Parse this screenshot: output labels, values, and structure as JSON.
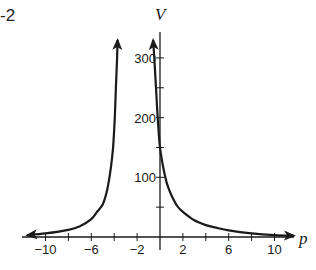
{
  "figure": {
    "partial_label": "-2"
  },
  "chart_data": {
    "type": "line",
    "title": "",
    "xlabel": "p",
    "ylabel": "V",
    "xlim": [
      -11.5,
      11.5
    ],
    "ylim": [
      0,
      320
    ],
    "x_ticks": [
      -10,
      -8,
      -6,
      -4,
      -2,
      2,
      4,
      6,
      8,
      10
    ],
    "x_tick_labels": [
      {
        "value": -10,
        "label": "−10"
      },
      {
        "value": -6,
        "label": "−6"
      },
      {
        "value": -2,
        "label": "−2"
      },
      {
        "value": 2,
        "label": "2"
      },
      {
        "value": 6,
        "label": "6"
      },
      {
        "value": 10,
        "label": "10"
      }
    ],
    "y_ticks": [
      50,
      100,
      150,
      200,
      250,
      300
    ],
    "y_tick_labels": [
      {
        "value": 100,
        "label": "100"
      },
      {
        "value": 200,
        "label": "200"
      },
      {
        "value": 300,
        "label": "300"
      }
    ],
    "grid": false,
    "legend": null,
    "vertical_asymptote_approx": -2,
    "series": [
      {
        "name": "left branch",
        "points": [
          [
            -11.6,
            3
          ],
          [
            -10,
            6
          ],
          [
            -8,
            12
          ],
          [
            -7,
            18
          ],
          [
            -6,
            30
          ],
          [
            -5.5,
            42
          ],
          [
            -5,
            55
          ],
          [
            -4.6,
            80
          ],
          [
            -4.3,
            115
          ],
          [
            -4.1,
            150
          ],
          [
            -3.95,
            200
          ],
          [
            -3.85,
            250
          ],
          [
            -3.75,
            300
          ],
          [
            -3.7,
            330
          ]
        ],
        "arrow_start": true,
        "arrow_end": true
      },
      {
        "name": "right branch",
        "points": [
          [
            -0.6,
            330
          ],
          [
            -0.5,
            300
          ],
          [
            -0.35,
            250
          ],
          [
            -0.2,
            200
          ],
          [
            0,
            150
          ],
          [
            0.3,
            115
          ],
          [
            0.6,
            90
          ],
          [
            1,
            70
          ],
          [
            1.5,
            52
          ],
          [
            2,
            42
          ],
          [
            3,
            28
          ],
          [
            4,
            20
          ],
          [
            5,
            15
          ],
          [
            6,
            11
          ],
          [
            8,
            6
          ],
          [
            10,
            3
          ],
          [
            11.7,
            2
          ]
        ],
        "arrow_start": true,
        "arrow_end": true
      }
    ]
  }
}
